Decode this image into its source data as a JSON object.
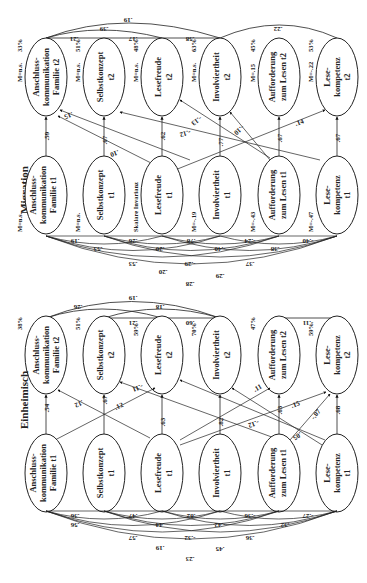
{
  "figure": {
    "type": "path-diagram",
    "orientation": "rotated",
    "panels": [
      {
        "id": "migration",
        "title": "Migration",
        "invariance_note": "Skalare Invarianz",
        "t2_nodes": [
          {
            "label": [
              "Anschluss-",
              "kommunikation",
              "Familie t2"
            ],
            "M": "M=n.s.",
            "r2": "33%"
          },
          {
            "label": [
              "Selbstkonzept",
              "t2"
            ],
            "M": "M=n.s.",
            "r2": "51%"
          },
          {
            "label": [
              "Lesefreude",
              "t2"
            ],
            "M": "M=n.s.",
            "r2": "48%"
          },
          {
            "label": [
              "Involviertheit",
              "t2"
            ],
            "M": "M=n.s.",
            "r2": "63%"
          },
          {
            "label": [
              "Aufforderung",
              "zum Lesen t2"
            ],
            "M": "M=.15",
            "r2": "45%"
          },
          {
            "label": [
              "Lese-",
              "kompetenz",
              "t2"
            ],
            "M": "M=-.22",
            "r2": "53%"
          }
        ],
        "t1_nodes": [
          {
            "label": [
              "Anschluss-",
              "kommunikation",
              "Familie t1"
            ],
            "M": "M=n.s."
          },
          {
            "label": [
              "Selbstkonzept",
              "t1"
            ],
            "M": "M=n.s."
          },
          {
            "label": [
              "Lesefreude",
              "t1"
            ],
            "M": "Skalare Invarianz"
          },
          {
            "label": [
              "Involviertheit",
              "t1"
            ],
            "M": "M=-.19"
          },
          {
            "label": [
              "Aufforderung",
              "zum Lesen t1"
            ],
            "M": "M=-.43"
          },
          {
            "label": [
              "Lese-",
              "kompetenz",
              "t1"
            ],
            "M": "M=-.47"
          }
        ],
        "stability_paths": [
          ".59",
          ".67",
          ".62",
          ".77",
          ".67",
          ".67"
        ],
        "cross_paths": [
          ".15",
          ".10",
          "-.12",
          "-.13",
          "-.10",
          ".14"
        ],
        "t2_correlations": [
          ".21",
          ".17",
          ".58",
          ".39",
          ".19",
          ".22"
        ],
        "t1_correlations": [
          ".19",
          ".26",
          ".78",
          "-.24",
          "-.40",
          ".53",
          ".20",
          "-.40",
          ".38",
          ".53",
          "-.29",
          ".37",
          ".20",
          ".29",
          ".28"
        ]
      },
      {
        "id": "einheimisch",
        "title": "Einheimisch",
        "t2_nodes": [
          {
            "label": [
              "Anschluss-",
              "kommunikation",
              "Familie t2"
            ],
            "r2": "38%"
          },
          {
            "label": [
              "Selbstkonzept",
              "t2"
            ],
            "r2": "51%"
          },
          {
            "label": [
              "Lesefreude",
              "t2"
            ],
            "r2": "59%"
          },
          {
            "label": [
              "Involviertheit",
              "t2"
            ],
            "r2": "70%"
          },
          {
            "label": [
              "Aufforderung",
              "zum Lesen t2"
            ],
            "r2": "47%"
          },
          {
            "label": [
              "Lese-",
              "kompetenz",
              "t2"
            ],
            "r2": "59%"
          }
        ],
        "t1_nodes": [
          {
            "label": [
              "Anschluss-",
              "kommunikation",
              "Familie t1"
            ]
          },
          {
            "label": [
              "Selbstkonzept",
              "t1"
            ]
          },
          {
            "label": [
              "Lesefreude",
              "t1"
            ]
          },
          {
            "label": [
              "Involviertheit",
              "t1"
            ]
          },
          {
            "label": [
              "Aufforderung",
              "zum Lesen t1"
            ]
          },
          {
            "label": [
              "Lese-",
              "kompetenz",
              "t1"
            ]
          }
        ],
        "stability_paths": [
          ".54",
          ".67",
          ".63",
          ".82",
          ".63",
          ".68"
        ],
        "cross_paths": [
          ".12",
          ".12",
          "-.11",
          "-.12",
          ".11",
          ".15",
          "-.07",
          ".05"
        ],
        "t2_correlations": [
          ".21",
          ".60",
          ".18",
          ".26",
          ".19",
          "-.11"
        ],
        "t1_correlations": [
          ".36",
          ".47",
          ".82",
          "-.36",
          "-.27",
          ".56",
          ".44",
          "-.42",
          ".32",
          ".57",
          "-.32",
          ".36",
          ".19",
          ".45",
          ".23"
        ]
      }
    ]
  }
}
